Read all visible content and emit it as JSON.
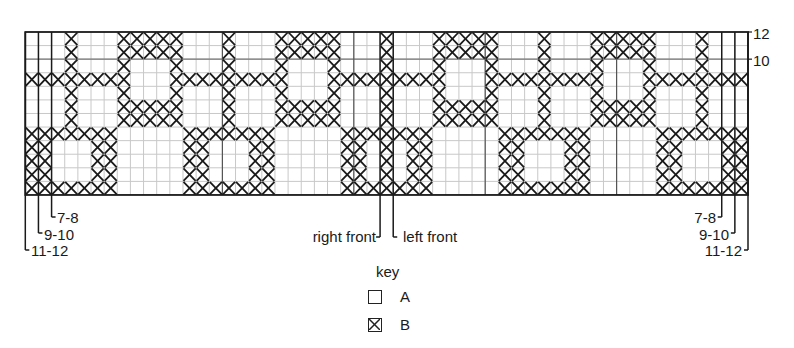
{
  "chart": {
    "columns": 55,
    "rows": 12,
    "origin": {
      "x": 25.3,
      "y": 32
    },
    "cell_width": 13.14,
    "cell_height": 13.58,
    "grid_color": "#c8c8c8",
    "border_color": "#1a1a1a",
    "stitch_color": "#1a1a1a",
    "pattern_rows": [
      "...X...XXXXX...X...XXXXX...X...XXXXX...X...XXXXX...X...",
      "...X...XXXXX...X...XXXXX...X...XXXXX...X...XXXXX...X...",
      "...X...X...X...X...X...X...X...X...X...X...X...X...X...",
      "XXXXXXXX...XXXXXXXXX...XXXXXXXXX...XXXXXXXXX...XXXXXXXX",
      "...X...X...X...X...X...X...X...X...X...X...X...X...X...",
      "...X...XXXXX...X...XXXXX...X...XXXXX...X...XXXXX...X...",
      "...X...XXXXX...X...XXXXX...X...XXXXX...X...XXXXX...X...",
      "XXXXXXX.....XXXXXXX.....XXXXXXX.....XXXXXXX.....XXXXXXX",
      "XX...XX.....XX...XX.....XX.X.XX.....XX...XX.....XX...XX",
      "XX...XX.....XX...XX.....XX.X.XX.....XX...XX.....XX...XX",
      "XX...XX.....XX...XX.....XX.X.XX.....XX...XX.....XX...XX",
      "XXXXXXX.....XXXXXXX.....XXXXXXX.....XXXXXXX.....XXXXXXX"
    ],
    "dark_row_lines": [
      2
    ],
    "dark_col_lines": [
      15,
      25,
      35,
      45
    ],
    "row_labels": [
      {
        "text": "12",
        "row_line": 0
      },
      {
        "text": "10",
        "row_line": 2
      }
    ],
    "size_lines_left": [
      {
        "label": "11-12",
        "col_line": 0,
        "end_y": 250,
        "label_x": 31,
        "label_y": 243
      },
      {
        "label": "9-10",
        "col_line": 1,
        "end_y": 233,
        "label_x": 44,
        "label_y": 227
      },
      {
        "label": "7-8",
        "col_line": 2,
        "end_y": 217,
        "label_x": 57,
        "label_y": 210
      }
    ],
    "size_lines_right": [
      {
        "label": "7-8",
        "col_line": 53,
        "end_y": 217,
        "label_right": 716,
        "label_y": 210
      },
      {
        "label": "9-10",
        "col_line": 54,
        "end_y": 233,
        "label_right": 729,
        "label_y": 227
      },
      {
        "label": "11-12",
        "col_line": 55,
        "end_y": 250,
        "label_right": 742,
        "label_y": 243
      }
    ],
    "front_markers": [
      {
        "label": "right front",
        "col_line": 27,
        "end_y": 237,
        "side": "left",
        "label_edge": 376,
        "label_y": 229
      },
      {
        "label": "left front",
        "col_line": 28,
        "end_y": 237,
        "side": "right",
        "label_edge": 403,
        "label_y": 229
      }
    ]
  },
  "key": {
    "title": "key",
    "items": [
      {
        "symbol": "empty-square",
        "label": "A",
        "meaning": "contrast color A"
      },
      {
        "symbol": "crossed-square",
        "label": "B",
        "meaning": "contrast color B"
      }
    ]
  }
}
